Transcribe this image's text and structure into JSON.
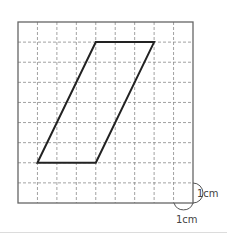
{
  "diagram": {
    "type": "grid-figure",
    "grid": {
      "columns": 9,
      "rows": 9,
      "cell_size_label": "1cm"
    },
    "shape": {
      "name": "parallelogram",
      "vertices_grid": [
        [
          1,
          7
        ],
        [
          4,
          7
        ],
        [
          7,
          1
        ],
        [
          4,
          1
        ]
      ]
    },
    "labels": {
      "vertical_unit": "1cm",
      "horizontal_unit": "1cm"
    },
    "colors": {
      "border": "#666666",
      "grid": "#8a8a8a",
      "shape": "#222222"
    }
  }
}
